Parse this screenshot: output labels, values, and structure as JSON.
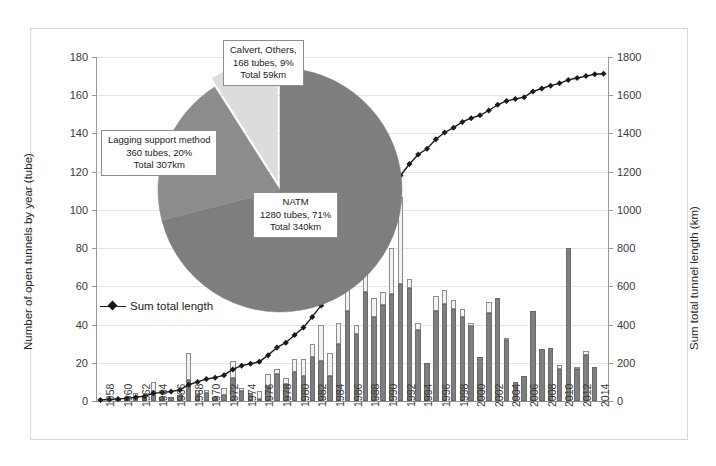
{
  "chart_data": {
    "type": "bar",
    "title": "",
    "subtitle": "",
    "xlabel": "",
    "ylabel": "Number of open tunnels by year (tube)",
    "y2label": "Sum total tunnel length (km)",
    "ylim": [
      0,
      180
    ],
    "y2lim": [
      0,
      1800
    ],
    "yticks": [
      0,
      20,
      40,
      60,
      80,
      100,
      120,
      140,
      160,
      180
    ],
    "y2ticks": [
      0,
      200,
      400,
      600,
      800,
      1000,
      1200,
      1400,
      1600,
      1800
    ],
    "grid": true,
    "legend_position": "inside-left",
    "legend": [
      "Sum total length"
    ],
    "x": [
      1958,
      1959,
      1960,
      1961,
      1962,
      1963,
      1964,
      1965,
      1966,
      1967,
      1968,
      1969,
      1970,
      1971,
      1972,
      1973,
      1974,
      1975,
      1976,
      1977,
      1978,
      1979,
      1980,
      1981,
      1982,
      1983,
      1984,
      1985,
      1986,
      1987,
      1988,
      1989,
      1990,
      1991,
      1992,
      1993,
      1994,
      1995,
      1996,
      1997,
      1998,
      1999,
      2000,
      2001,
      2002,
      2003,
      2004,
      2005,
      2006,
      2007,
      2008,
      2009,
      2010,
      2011,
      2012,
      2013,
      2014,
      2015
    ],
    "xtick_labels": [
      "1958",
      "1960",
      "1962",
      "1964",
      "1966",
      "1968",
      "1970",
      "1972",
      "1974",
      "1976",
      "1978",
      "1980",
      "1982",
      "1984",
      "1986",
      "1988",
      "1990",
      "1992",
      "1994",
      "1996",
      "1998",
      "2000",
      "2002",
      "2004",
      "2006",
      "2008",
      "2010",
      "2012",
      "2014"
    ],
    "series": [
      {
        "name": "Tunnels (lower segment)",
        "stack": "tubes",
        "color": "#7e7e7e",
        "values": [
          1,
          1,
          1,
          1,
          2,
          2,
          5,
          2,
          2,
          3,
          11,
          3,
          4,
          2,
          3,
          12,
          5,
          4,
          1,
          8,
          14,
          9,
          15,
          13,
          23,
          21,
          13,
          30,
          47,
          35,
          57,
          44,
          50,
          56,
          61,
          59,
          37,
          20,
          47,
          51,
          48,
          44,
          39,
          23,
          46,
          54,
          32,
          10,
          13,
          47,
          27,
          28,
          17,
          80,
          17,
          24,
          18,
          0
        ]
      },
      {
        "name": "Tunnels (upper segment)",
        "stack": "tubes",
        "color": "#f2f2f2",
        "values": [
          0,
          0,
          0,
          0,
          2,
          0,
          5,
          0,
          0,
          0,
          14,
          3,
          2,
          0,
          4,
          9,
          2,
          0,
          4,
          6,
          3,
          3,
          7,
          9,
          7,
          19,
          12,
          11,
          12,
          5,
          34,
          10,
          7,
          24,
          46,
          5,
          4,
          0,
          8,
          7,
          5,
          4,
          2,
          0,
          6,
          0,
          1,
          0,
          0,
          0,
          0,
          0,
          2,
          0,
          1,
          2,
          0,
          0
        ]
      },
      {
        "name": "Sum total length",
        "type": "line",
        "axis": "y2",
        "color": "#1a1a1a",
        "marker": "diamond",
        "unit": "km",
        "values": [
          5,
          8,
          11,
          14,
          20,
          25,
          40,
          45,
          50,
          58,
          85,
          100,
          115,
          122,
          135,
          165,
          185,
          195,
          205,
          240,
          280,
          305,
          345,
          385,
          440,
          500,
          540,
          610,
          700,
          770,
          880,
          950,
          1020,
          1090,
          1180,
          1240,
          1290,
          1320,
          1370,
          1405,
          1430,
          1460,
          1480,
          1495,
          1520,
          1550,
          1570,
          1580,
          1590,
          1620,
          1635,
          1650,
          1662,
          1680,
          1690,
          1700,
          1710,
          1712
        ]
      }
    ]
  },
  "pie_data": {
    "type": "pie",
    "title": "",
    "slices": [
      {
        "name": "NATM",
        "percent": 71,
        "tubes": 1280,
        "total_km": 340,
        "color": "#7e7e7e",
        "label_lines": [
          "NATM",
          "1280 tubes, 71%",
          "Total 340km"
        ]
      },
      {
        "name": "Lagging support method",
        "percent": 20,
        "tubes": 360,
        "total_km": 307,
        "color": "#8c8c8c",
        "label_lines": [
          "Lagging support method",
          "360 tubes, 20%",
          "Total 307km"
        ]
      },
      {
        "name": "Calvert, Others",
        "percent": 9,
        "tubes": 168,
        "total_km": 59,
        "color": "#dcdcdc",
        "exploded": true,
        "label_lines": [
          "Calvert, Others,",
          "168 tubes, 9%",
          "Total 59km"
        ]
      }
    ]
  },
  "callouts": {
    "others": {
      "line1": "Calvert, Others,",
      "line2": "168 tubes, 9%",
      "line3": "Total 59km"
    },
    "lagging": {
      "line1": "Lagging support method",
      "line2": "360 tubes, 20%",
      "line3": "Total 307km"
    },
    "natm": {
      "line1": "NATM",
      "line2": "1280 tubes, 71%",
      "line3": "Total 340km"
    }
  },
  "legend": {
    "sum_total_length": "Sum total length"
  },
  "axes": {
    "y_left_title": "Number of open tunnels by year (tube)",
    "y_right_title": "Sum total tunnel length (km)"
  },
  "colors": {
    "bar_lower": "#7e7e7e",
    "bar_upper": "#f2f2f2",
    "line": "#1a1a1a",
    "grid": "#e4e4e4",
    "frame": "#d9d9d9"
  }
}
